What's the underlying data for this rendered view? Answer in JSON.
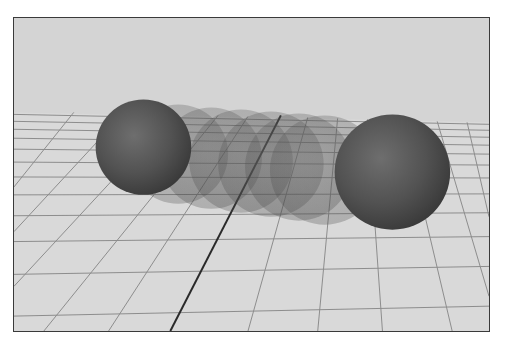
{
  "viewport": {
    "kind": "3d-viewport",
    "background_color": "#d4d4d4",
    "ground_color": "#d9d9d9",
    "grid_line_color": "#8a8a8a",
    "axis_line_color": "#2a2a2a",
    "frame_color": "#3a3a3a"
  },
  "scene": {
    "objects": [
      {
        "name": "sphere-start",
        "type": "sphere",
        "cx": 130,
        "cy": 130,
        "r": 48,
        "opacity": 1.0
      },
      {
        "name": "ghost-1",
        "type": "sphere",
        "cx": 165,
        "cy": 137,
        "r": 50,
        "opacity": 0.28
      },
      {
        "name": "ghost-2",
        "type": "sphere",
        "cx": 198,
        "cy": 141,
        "r": 51,
        "opacity": 0.28
      },
      {
        "name": "ghost-3",
        "type": "sphere",
        "cx": 228,
        "cy": 144,
        "r": 52,
        "opacity": 0.28
      },
      {
        "name": "ghost-4",
        "type": "sphere",
        "cx": 258,
        "cy": 147,
        "r": 53,
        "opacity": 0.28
      },
      {
        "name": "ghost-5",
        "type": "sphere",
        "cx": 286,
        "cy": 150,
        "r": 54,
        "opacity": 0.28
      },
      {
        "name": "ghost-6",
        "type": "sphere",
        "cx": 312,
        "cy": 153,
        "r": 55,
        "opacity": 0.28
      },
      {
        "name": "sphere-end",
        "type": "sphere",
        "cx": 380,
        "cy": 155,
        "r": 58,
        "opacity": 1.0
      }
    ],
    "sphere_color": "#555555"
  }
}
